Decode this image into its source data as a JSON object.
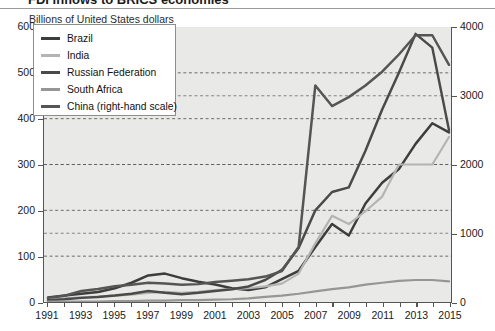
{
  "title_fragment": "FDI inflows to BRICS economies",
  "subtitle": "Billions of United States dollars",
  "legend": {
    "items": [
      {
        "label": "Brazil",
        "color": "#3d3d3d",
        "width": 3.2
      },
      {
        "label": "India",
        "color": "#b4b4b4",
        "width": 2.6
      },
      {
        "label": "Russian Federation",
        "color": "#4a4a4a",
        "width": 3.2
      },
      {
        "label": "South Africa",
        "color": "#969696",
        "width": 2.6
      },
      {
        "label": "China (right-hand scale)",
        "color": "#555555",
        "width": 3.2
      }
    ]
  },
  "axes": {
    "left_ticks": [
      "600",
      "500",
      "400",
      "300",
      "200",
      "100",
      "0"
    ],
    "right_ticks": [
      "4000",
      "3000",
      "2000",
      "1000",
      "0"
    ],
    "x_ticks": [
      "1991",
      "1993",
      "1995",
      "1997",
      "1999",
      "2001",
      "2003",
      "2005",
      "2007",
      "2009",
      "2011",
      "2013",
      "2015"
    ]
  },
  "chart_data": {
    "type": "line",
    "title": "FDI inflows to BRICS economies",
    "subtitle": "Billions of United States dollars",
    "xlabel": "",
    "ylabel": "Billions of United States dollars",
    "ylim": [
      0,
      600
    ],
    "ylim_right": [
      0,
      4000
    ],
    "grid": "horizontal-dashed",
    "legend_position": "top-left",
    "x": [
      1991,
      1992,
      1993,
      1994,
      1995,
      1996,
      1997,
      1998,
      1999,
      2000,
      2001,
      2002,
      2003,
      2004,
      2005,
      2006,
      2007,
      2008,
      2009,
      2010,
      2011,
      2012,
      2013,
      2014,
      2015
    ],
    "series": [
      {
        "name": "Brazil",
        "axis": "left",
        "color": "#3d3d3d",
        "values": [
          10,
          14,
          18,
          22,
          30,
          42,
          58,
          62,
          52,
          44,
          38,
          30,
          26,
          32,
          50,
          68,
          120,
          170,
          145,
          215,
          260,
          290,
          345,
          390,
          370
        ]
      },
      {
        "name": "India",
        "axis": "left",
        "color": "#b4b4b4",
        "values": [
          6,
          8,
          10,
          12,
          14,
          16,
          20,
          22,
          20,
          22,
          26,
          28,
          30,
          34,
          40,
          62,
          128,
          188,
          170,
          198,
          230,
          300,
          300,
          300,
          360
        ]
      },
      {
        "name": "Russian Federation",
        "axis": "left",
        "color": "#4a4a4a",
        "values": [
          4,
          6,
          9,
          11,
          14,
          18,
          24,
          20,
          17,
          20,
          24,
          28,
          34,
          48,
          70,
          118,
          200,
          240,
          250,
          330,
          420,
          500,
          585,
          555,
          375
        ]
      },
      {
        "name": "South Africa",
        "axis": "left",
        "color": "#969696",
        "values": [
          1,
          1,
          1,
          1,
          2,
          2,
          3,
          3,
          4,
          4,
          5,
          6,
          8,
          11,
          14,
          18,
          23,
          28,
          32,
          38,
          42,
          46,
          48,
          48,
          45
        ]
      },
      {
        "name": "China (right-hand scale)",
        "axis": "right",
        "color": "#555555",
        "values": [
          60,
          90,
          160,
          190,
          230,
          250,
          280,
          270,
          250,
          260,
          290,
          310,
          330,
          370,
          450,
          800,
          3150,
          2850,
          2980,
          3150,
          3350,
          3600,
          3880,
          3880,
          3450
        ]
      }
    ]
  }
}
